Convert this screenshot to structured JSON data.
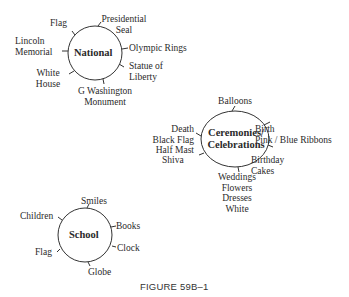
{
  "clusters": {
    "national": {
      "title": "National",
      "items": {
        "flag": "Flag",
        "presidential_seal_1": "Presidential",
        "presidential_seal_2": "Seal",
        "lincoln_1": "Lincoln",
        "lincoln_2": "Memorial",
        "olympic": "Olympic Rings",
        "statue_1": "Statue of",
        "statue_2": "Liberty",
        "white_house_1": "White",
        "white_house_2": "House",
        "washington_1": "G Washington",
        "washington_2": "Monument"
      }
    },
    "ceremonies": {
      "title_1": "Ceremonies/",
      "title_2": "Celebrations",
      "items": {
        "balloons": "Balloons",
        "death_1": "Death",
        "death_2": "Black Flag",
        "death_3": "Half Mast",
        "birth_1": "Birth",
        "birth_2": "Pink / Blue Ribbons",
        "shiva": "Shiva",
        "birthday_1": "Birthday",
        "birthday_2": "Cakes",
        "weddings_1": "Weddings",
        "weddings_2": "Flowers",
        "weddings_3": "Dresses",
        "weddings_4": "White"
      }
    },
    "school": {
      "title": "School",
      "items": {
        "smiles": "Smiles",
        "children": "Children",
        "books": "Books",
        "clock": "Clock",
        "flag": "Flag",
        "globe": "Globe"
      }
    }
  },
  "caption": "FIGURE 59B–1"
}
